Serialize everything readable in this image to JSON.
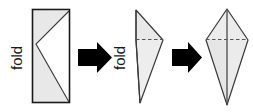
{
  "diagram": {
    "background_color": "#ffffff",
    "ink_color": "#1a1a1a",
    "paper_fill": "#ffffff",
    "shade_fill": "#e8e8e8",
    "crease_color": "#555555",
    "arrow_color": "#000000",
    "labels": {
      "fold_1": "fold",
      "fold_2": "fold"
    },
    "steps": [
      {
        "id": "step-1",
        "shape": "rectangle-with-diagonal-flap",
        "label": "fold",
        "description": "Rectangular sheet of paper with a diagonal flap folded over"
      },
      {
        "id": "arrow-1",
        "shape": "block-arrow-right",
        "description": "Right pointing arrow between step 1 and step 2"
      },
      {
        "id": "step-2",
        "shape": "folded-triangle-with-dashed-crease",
        "label": "fold",
        "description": "Paper folded into a narrow triangle with a horizontal dashed crease line"
      },
      {
        "id": "arrow-2",
        "shape": "block-arrow-right",
        "description": "Right pointing arrow between step 2 and step 3"
      },
      {
        "id": "step-3",
        "shape": "kite-with-dashed-crease",
        "description": "Final kite shape with vertical centre fold and horizontal dashed crease"
      }
    ]
  }
}
